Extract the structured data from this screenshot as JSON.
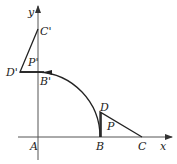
{
  "diagram": {
    "axes": {
      "x_label": "x",
      "y_label": "y"
    },
    "points": {
      "A": {
        "label": "A",
        "x": 38,
        "y": 137
      },
      "B": {
        "label": "B",
        "x": 100,
        "y": 137
      },
      "C": {
        "label": "C",
        "x": 142,
        "y": 137
      },
      "D": {
        "label": "D",
        "x": 100,
        "y": 112
      },
      "P": {
        "label": "P"
      },
      "Bp": {
        "label": "B'",
        "x": 38,
        "y": 72
      },
      "Cp": {
        "label": "C'",
        "x": 38,
        "y": 29
      },
      "Dp": {
        "label": "D'",
        "x": 20,
        "y": 72
      },
      "Pp": {
        "label": "P'"
      }
    },
    "colors": {
      "stroke": "#222222",
      "axis": "#555555"
    }
  }
}
